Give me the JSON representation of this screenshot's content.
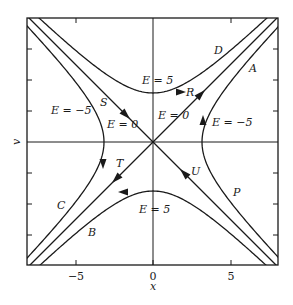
{
  "chart_data": {
    "type": "line",
    "title": "",
    "xlabel": "x",
    "ylabel": "v",
    "xlim": [
      -8,
      8
    ],
    "ylim": [
      -8,
      8
    ],
    "grid": false,
    "x_ticks": [
      -5,
      0,
      5
    ],
    "x_tick_labels": [
      "−5",
      "0",
      "5"
    ],
    "y_ticks": [
      -6,
      -4,
      -2,
      0,
      2,
      4,
      6
    ],
    "y_tick_labels": [],
    "series": [
      {
        "name": "D",
        "energy": 5,
        "equation": "v = +sqrt(x^2 + 10)",
        "direction": "rightward",
        "arrow_label": "R"
      },
      {
        "name": "B",
        "energy": 5,
        "equation": "v = -sqrt(x^2 + 10)",
        "direction": "leftward"
      },
      {
        "name": "A / P",
        "energy": -5,
        "equation": "x = +sqrt(v^2 + 10)",
        "direction": "upward"
      },
      {
        "name": "C",
        "energy": -5,
        "equation": "x = -sqrt(v^2 + 10)",
        "direction": "downward"
      },
      {
        "name": "separatrix v = x",
        "energy": 0,
        "equation": "v = x",
        "direction": "outward from origin",
        "arrow_labels": [
          "R",
          "T"
        ]
      },
      {
        "name": "separatrix v = -x",
        "energy": 0,
        "equation": "v = -x",
        "direction": "inward to origin",
        "arrow_labels": [
          "S",
          "U"
        ]
      }
    ],
    "annotations": [
      {
        "text": "E = 5",
        "x": 0.5,
        "y": 3.8
      },
      {
        "text": "E = 5",
        "x": 0.2,
        "y": -4.4
      },
      {
        "text": "E = −5",
        "x": -5.5,
        "y": 2.1
      },
      {
        "text": "E = −5",
        "x": 4.5,
        "y": 1.0
      },
      {
        "text": "E = 0",
        "x": -2.5,
        "y": 0.9
      },
      {
        "text": "E = 0",
        "x": 0.8,
        "y": 1.6
      },
      {
        "text": "A",
        "x": 6.4,
        "y": 4.7
      },
      {
        "text": "D",
        "x": 4.2,
        "y": 5.9
      },
      {
        "text": "R",
        "x": 2.2,
        "y": 3.2
      },
      {
        "text": "S",
        "x": -3.0,
        "y": 2.5
      },
      {
        "text": "T",
        "x": -2.0,
        "y": -1.9
      },
      {
        "text": "U",
        "x": 2.7,
        "y": -1.9
      },
      {
        "text": "P",
        "x": 5.3,
        "y": -3.2
      },
      {
        "text": "C",
        "x": -6.2,
        "y": -4.1
      },
      {
        "text": "B",
        "x": -4.0,
        "y": -5.9
      }
    ]
  },
  "labels": {
    "xlabel": "x",
    "ylabel": "v",
    "xticks": [
      "−5",
      "0",
      "5"
    ],
    "e5_top": "E = 5",
    "e5_bottom": "E = 5",
    "em5_left": "E = −5",
    "em5_right": "E = −5",
    "e0_left": "E = 0",
    "e0_right": "E = 0",
    "A": "A",
    "B": "B",
    "C": "C",
    "D": "D",
    "P": "P",
    "R": "R",
    "S": "S",
    "T": "T",
    "U": "U"
  }
}
